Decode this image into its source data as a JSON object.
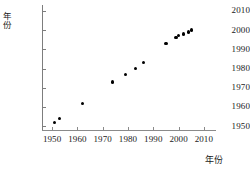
{
  "chart_data": {
    "type": "scatter",
    "title": "",
    "xlabel": "年份",
    "ylabel": "年份",
    "xlim": [
      1946,
      2014
    ],
    "ylim": [
      1948,
      2012
    ],
    "grid": false,
    "legend": null,
    "xticks": [
      1950,
      1960,
      1970,
      1980,
      1990,
      2000,
      2010
    ],
    "yticks": [
      1950,
      1960,
      1970,
      1980,
      1990,
      2000,
      2010
    ],
    "xtick_labels": [
      "1950",
      "1960",
      "1970",
      "1980",
      "1990",
      "2000",
      "2010"
    ],
    "ytick_labels": [
      "1950",
      "1960",
      "1970",
      "1980",
      "1990",
      "2000",
      "2010"
    ],
    "marker": "filled-circle",
    "marker_color": "#000000",
    "points": [
      {
        "x": 1951,
        "y": 1952
      },
      {
        "x": 1953,
        "y": 1954
      },
      {
        "x": 1962,
        "y": 1962
      },
      {
        "x": 1974,
        "y": 1973
      },
      {
        "x": 1979,
        "y": 1977
      },
      {
        "x": 1983,
        "y": 1980
      },
      {
        "x": 1986,
        "y": 1983
      },
      {
        "x": 1995,
        "y": 1993
      },
      {
        "x": 1999,
        "y": 1996
      },
      {
        "x": 2000,
        "y": 1997
      },
      {
        "x": 2002,
        "y": 1998
      },
      {
        "x": 2004,
        "y": 1999
      },
      {
        "x": 2005,
        "y": 2000
      }
    ]
  }
}
